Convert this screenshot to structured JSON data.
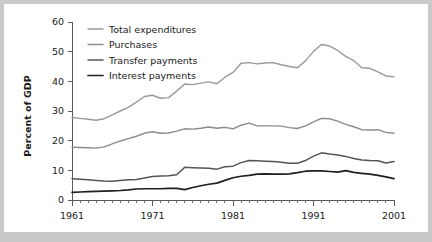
{
  "figure": {
    "background_color": "#c9c9c9",
    "card_color": "#ffffff"
  },
  "chart_data": {
    "type": "line",
    "title": "",
    "subtitle": "",
    "xlabel": "",
    "ylabel": "Percent of GDP",
    "xlim": [
      1961,
      2001
    ],
    "ylim": [
      0,
      60
    ],
    "grid": false,
    "legend_position": "top-left",
    "y_ticks": [
      0,
      10,
      20,
      30,
      40,
      50,
      60
    ],
    "y_tick_labels": [
      "0",
      "10",
      "20",
      "30",
      "40",
      "50",
      "60"
    ],
    "x_ticks": [
      1961,
      1971,
      1981,
      1991,
      2001
    ],
    "x_tick_labels": [
      "1961",
      "1971",
      "1981",
      "1991",
      "2001"
    ],
    "x_minor_tick_step": 1,
    "x": [
      1961,
      1962,
      1963,
      1964,
      1965,
      1966,
      1967,
      1968,
      1969,
      1970,
      1971,
      1972,
      1973,
      1974,
      1975,
      1976,
      1977,
      1978,
      1979,
      1980,
      1981,
      1982,
      1983,
      1984,
      1985,
      1986,
      1987,
      1988,
      1989,
      1990,
      1991,
      1992,
      1993,
      1994,
      1995,
      1996,
      1997,
      1998,
      1999,
      2000,
      2001
    ],
    "series": [
      {
        "name": "Total expenditures",
        "color": "#9a9a9a",
        "width": 1.4,
        "values": [
          27.8,
          27.5,
          27.2,
          26.9,
          27.4,
          28.7,
          30.0,
          31.2,
          33.0,
          34.9,
          35.3,
          34.3,
          34.5,
          36.7,
          39.1,
          38.9,
          39.4,
          39.8,
          39.2,
          41.4,
          43.0,
          46.1,
          46.3,
          45.9,
          46.2,
          46.3,
          45.6,
          45.0,
          44.6,
          46.9,
          50.1,
          52.4,
          51.9,
          50.4,
          48.4,
          47.0,
          44.6,
          44.4,
          43.2,
          41.8,
          41.5
        ]
      },
      {
        "name": "Purchases",
        "color": "#8c8c8c",
        "width": 1.4,
        "values": [
          17.8,
          17.7,
          17.6,
          17.5,
          17.9,
          18.9,
          19.9,
          20.7,
          21.5,
          22.5,
          23.0,
          22.5,
          22.6,
          23.2,
          24.0,
          23.9,
          24.2,
          24.6,
          24.2,
          24.5,
          24.0,
          25.2,
          25.9,
          25.0,
          25.0,
          25.0,
          24.9,
          24.4,
          24.1,
          25.0,
          26.3,
          27.5,
          27.4,
          26.6,
          25.5,
          24.7,
          23.7,
          23.6,
          23.7,
          22.8,
          22.5
        ]
      },
      {
        "name": "Transfer payments",
        "color": "#555555",
        "width": 1.5,
        "values": [
          7.2,
          7.0,
          6.8,
          6.6,
          6.4,
          6.3,
          6.6,
          6.8,
          6.9,
          7.4,
          7.9,
          8.1,
          8.2,
          8.5,
          11.0,
          10.9,
          10.8,
          10.7,
          10.4,
          11.2,
          11.4,
          12.6,
          13.3,
          13.2,
          13.1,
          13.0,
          12.7,
          12.4,
          12.4,
          13.3,
          14.8,
          15.9,
          15.5,
          15.2,
          14.7,
          14.0,
          13.5,
          13.3,
          13.2,
          12.5,
          13.0
        ]
      },
      {
        "name": "Interest payments",
        "color": "#1f1f1f",
        "width": 1.7,
        "values": [
          2.6,
          2.7,
          2.8,
          2.9,
          3.0,
          3.1,
          3.2,
          3.4,
          3.7,
          3.8,
          3.8,
          3.8,
          3.9,
          3.9,
          3.5,
          4.2,
          4.8,
          5.3,
          5.7,
          6.6,
          7.5,
          8.0,
          8.3,
          8.7,
          8.8,
          8.7,
          8.7,
          8.8,
          9.2,
          9.7,
          9.8,
          9.8,
          9.6,
          9.4,
          9.9,
          9.3,
          9.0,
          8.7,
          8.3,
          7.8,
          7.2
        ]
      }
    ]
  },
  "legend": {
    "entries": [
      {
        "label": "Total expenditures",
        "color": "#9a9a9a"
      },
      {
        "label": "Purchases",
        "color": "#8c8c8c"
      },
      {
        "label": "Transfer payments",
        "color": "#555555"
      },
      {
        "label": "Interest payments",
        "color": "#1f1f1f"
      }
    ]
  }
}
